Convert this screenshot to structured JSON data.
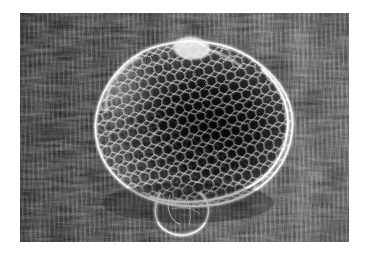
{
  "image": {
    "kind": "photograph",
    "style": "black-and-white",
    "alt": "Black and white photograph of a mesh net bag lying on grass",
    "frame": {
      "left": 20,
      "top": 13,
      "width": 329,
      "height": 229,
      "margin_color": "#ffffff"
    },
    "subject": {
      "name": "mesh-net-bag",
      "description": "A round net bag made of fine white mesh, lying open on the ground with a loop of cord hanging below",
      "center_x": 168,
      "center_y": 120,
      "radius_x": 96,
      "radius_y": 84
    },
    "background": {
      "name": "grass-ground",
      "description": "Dense dark tufted grass and vegetation with vertical streaking, brighter toward the right side"
    },
    "palette": {
      "paper": "#ffffff",
      "shadow": "#101010",
      "midtone": "#4a4a4a",
      "highlight": "#e8e8e8",
      "net_thread": "#f2f2f2",
      "net_void": "#0b0b0b"
    }
  }
}
